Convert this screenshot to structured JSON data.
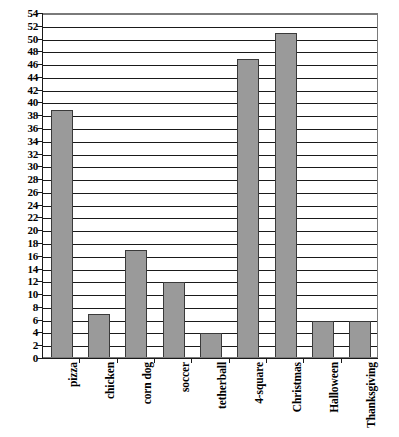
{
  "chart_data": {
    "type": "bar",
    "title": "",
    "subtitle": "",
    "xlabel": "",
    "ylabel": "",
    "categories": [
      "pizza",
      "chicken",
      "corn dog",
      "soccer",
      "tetherball",
      "4-square",
      "Christmas",
      "Halloween",
      "Thanksgiving"
    ],
    "values": [
      39,
      7,
      17,
      12,
      4,
      47,
      51,
      6,
      6
    ],
    "ylim": [
      0,
      54
    ],
    "ytick_step": 2,
    "yticks": [
      0,
      2,
      4,
      6,
      8,
      10,
      12,
      14,
      16,
      18,
      20,
      22,
      24,
      26,
      28,
      30,
      32,
      34,
      36,
      38,
      40,
      42,
      44,
      46,
      48,
      50,
      52,
      54
    ],
    "grid": true,
    "grid_axis": "y",
    "legend": false,
    "legend_position": "none",
    "bar_color": "#9a9a9a",
    "bar_border_color": "#3a3a3a",
    "gridline_color": "#1a1a1a",
    "axis_color": "#1a1a1a",
    "plot_background": "#ffffff",
    "label_rotation": -90,
    "annotations": []
  }
}
